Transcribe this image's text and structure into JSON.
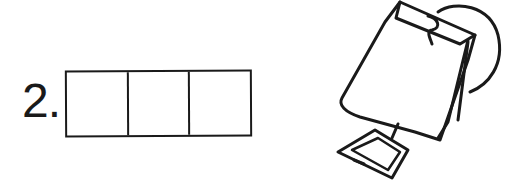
{
  "item": {
    "number_label": "2.",
    "boxes": [
      {
        "value": ""
      },
      {
        "value": ""
      },
      {
        "value": ""
      }
    ]
  },
  "illustration": {
    "subject": "tea-bag",
    "stroke_color": "#1a1a1a"
  }
}
